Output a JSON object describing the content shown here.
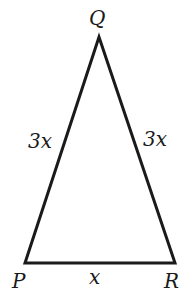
{
  "diagram": {
    "type": "isosceles-triangle",
    "vertices": {
      "Q": {
        "label": "Q",
        "x": 99,
        "y": 37
      },
      "P": {
        "label": "P",
        "x": 25,
        "y": 263
      },
      "R": {
        "label": "R",
        "x": 175,
        "y": 263
      }
    },
    "sides": {
      "PQ": {
        "label": "3x"
      },
      "QR": {
        "label": "3x"
      },
      "PR": {
        "label": "x"
      }
    },
    "stroke_color": "#1a1a1a"
  }
}
